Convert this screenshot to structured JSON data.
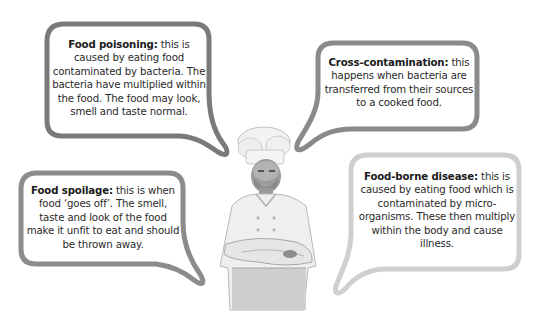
{
  "bubbles": [
    {
      "term": "Food poisoning:",
      "definition": " this is caused by eating food contaminated by bacteria. The bacteria have multiplied within the food. The food may look, smell and taste normal.",
      "border_color": "#7a7a7a"
    },
    {
      "term": "Cross-contamination:",
      "definition": " this happens when bacteria are transferred from their sources to a cooked food.",
      "border_color": "#8a8a8a"
    },
    {
      "term": "Food spoilage:",
      "definition": " this is when food ‘goes off’. The smell, taste and look of the food make it unfit to eat and should be thrown away.",
      "border_color": "#8c8c8c"
    },
    {
      "term": "Food-borne disease:",
      "definition": " this is caused by eating food which is contaminated by micro-organisms. These then multiply within the body and cause illness.",
      "border_color": "#cfcfcf"
    }
  ],
  "image": {
    "subject": "chef-with-arms-crossed"
  }
}
